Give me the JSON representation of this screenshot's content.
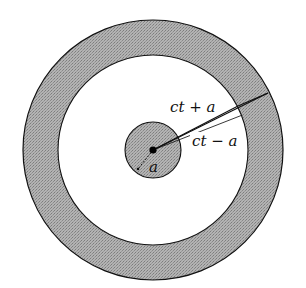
{
  "diagram": {
    "labels": {
      "outer_radius": "ct + a",
      "inner_radius": "ct − a",
      "source_radius": "a"
    },
    "colors": {
      "shell_fill": "#a9a9a9",
      "source_fill": "#a9a9a9",
      "background": "#ffffff",
      "stroke": "#111111"
    }
  }
}
